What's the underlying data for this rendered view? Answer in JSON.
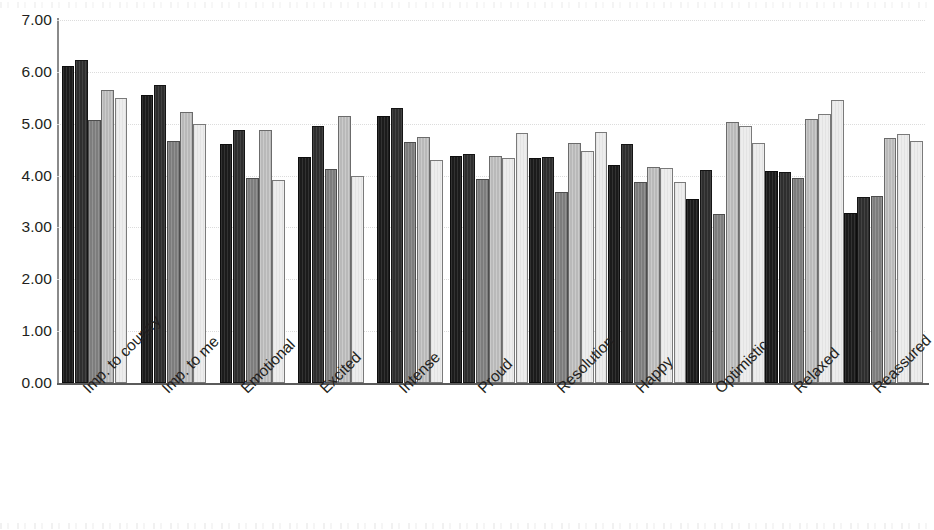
{
  "chart_data": {
    "type": "bar",
    "title": "",
    "subtitle": "",
    "xlabel": "",
    "ylabel": "",
    "ylim": [
      0,
      7
    ],
    "ytick_labels": [
      "7.00",
      "6.00",
      "5.00",
      "4.00",
      "3.00",
      "2.00",
      "1.00",
      "0.00"
    ],
    "ytick_values": [
      7,
      6,
      5,
      4,
      3,
      2,
      1,
      0
    ],
    "grid": "horizontal-dotted",
    "legend": "none",
    "legend_position": "none",
    "orientation": "vertical",
    "grouping": "clustered",
    "categories": [
      "Imp. to country",
      "Imp. to me",
      "Emotional",
      "Excited",
      "Intense",
      "Proud",
      "Resolution",
      "Happy",
      "Optimistic",
      "Relaxed",
      "Reassured"
    ],
    "series": [
      {
        "name": "Series 1",
        "color": "#1b1b1b",
        "values": [
          6.12,
          5.55,
          4.6,
          4.35,
          5.15,
          4.38,
          4.33,
          4.2,
          3.55,
          4.08,
          3.28
        ]
      },
      {
        "name": "Series 2",
        "color": "#2e2e2e",
        "values": [
          6.22,
          5.75,
          4.87,
          4.95,
          5.3,
          4.42,
          4.35,
          4.6,
          4.1,
          4.07,
          3.58
        ]
      },
      {
        "name": "Series 3",
        "color": "#7d7d7d",
        "values": [
          5.07,
          4.67,
          3.96,
          4.13,
          4.65,
          3.93,
          3.68,
          3.88,
          3.25,
          3.95,
          3.6
        ]
      },
      {
        "name": "Series 4",
        "color": "#b9b9b9",
        "values": [
          5.65,
          5.23,
          4.87,
          5.15,
          4.75,
          4.37,
          4.63,
          4.17,
          5.04,
          5.1,
          4.73
        ]
      },
      {
        "name": "Series 5",
        "color": "#ededed",
        "values": [
          5.5,
          5.0,
          3.92,
          4.0,
          4.3,
          4.33,
          4.47,
          4.15,
          4.95,
          5.18,
          4.8
        ]
      }
    ],
    "extra_bars_note": "Each category also shows a trailing lightest bar",
    "series_extra": {
      "name": "Series 6",
      "color": "#f4f4f4",
      "values": [
        null,
        null,
        null,
        null,
        null,
        4.83,
        4.85,
        3.88,
        4.62,
        5.46,
        4.66
      ]
    }
  },
  "axes": {
    "y_axis_name": "value-axis",
    "x_axis_name": "category-axis"
  }
}
